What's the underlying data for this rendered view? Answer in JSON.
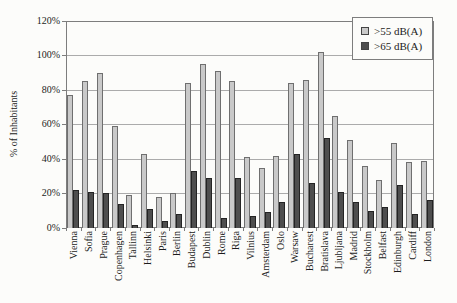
{
  "chart_data": {
    "type": "bar",
    "title": "",
    "xlabel": "",
    "ylabel": "% of Inhabitants",
    "ylim": [
      0,
      120
    ],
    "ytick_step": 20,
    "ytick_labels": [
      "0%",
      "20%",
      "40%",
      "60%",
      "80%",
      "100%",
      "120%"
    ],
    "grid": true,
    "legend_position": "top-right",
    "categories": [
      "Vienna",
      "Sofia",
      "Prague",
      "Copenhagen",
      "Tallinn",
      "Helsinki",
      "Paris",
      "Berlin",
      "Budapest",
      "Dublin",
      "Rome",
      "Riga",
      "Vilnius",
      "Amsterdam",
      "Oslo",
      "Warsaw",
      "Bucharest",
      "Bratislava",
      "Ljubljana",
      "Madrid",
      "Stockholm",
      "Belfast",
      "Edinburgh",
      "Cardiff",
      "London"
    ],
    "series": [
      {
        "name": ">55 dB(A)",
        "color": "#c9c9c9",
        "border_color": "#6f6f6f",
        "values": [
          77,
          85,
          90,
          59,
          19,
          43,
          18,
          20,
          84,
          95,
          91,
          85,
          41,
          35,
          42,
          84,
          86,
          102,
          65,
          51,
          36,
          28,
          49,
          38,
          39
        ]
      },
      {
        "name": ">65 dB(A)",
        "color": "#4e4e4e",
        "border_color": "#242424",
        "values": [
          22,
          21,
          20,
          14,
          2,
          11,
          4,
          8,
          33,
          29,
          6,
          29,
          7,
          9,
          15,
          43,
          26,
          52,
          21,
          15,
          10,
          12,
          25,
          8,
          16
        ]
      }
    ],
    "colors": {
      "gridline": "#ababab",
      "plot_border": "#7d7d7d",
      "background": "#fcfcfa",
      "text": "#1c1c1c"
    }
  }
}
